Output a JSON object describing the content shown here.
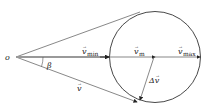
{
  "diagram": {
    "origin_label": "o",
    "angle_label": "β",
    "v_min_label": "v",
    "v_min_sub": "min",
    "v_m_label": "v",
    "v_m_sub": "m",
    "v_max_label": "v",
    "v_max_sub": "max",
    "v_label": "v",
    "delta_v_label": "Δv",
    "colors": {
      "line": "#333333",
      "thick": "#999999",
      "background": "#ffffff"
    }
  }
}
